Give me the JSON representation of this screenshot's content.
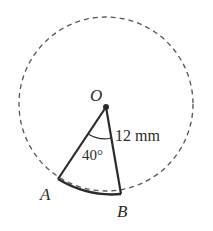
{
  "diagram": {
    "type": "circle-sector",
    "circle": {
      "cx": 106,
      "cy": 104,
      "r": 87,
      "style": "dashed"
    },
    "center": {
      "label": "O",
      "x": 106,
      "y": 107
    },
    "points": [
      {
        "label": "A",
        "x": 58,
        "y": 179
      },
      {
        "label": "B",
        "x": 121,
        "y": 194
      }
    ],
    "radius_label": "12 mm",
    "angle_label": "40°",
    "colors": {
      "stroke": "#2b2b2b",
      "dashed": "#555555",
      "background": "#ffffff"
    }
  }
}
